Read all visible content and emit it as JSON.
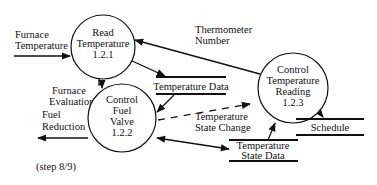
{
  "diagram": {
    "type": "data-flow-diagram",
    "caption": "(step 8/9)",
    "processes": [
      {
        "id": "1.2.1",
        "line1": "Read",
        "line2": "Temperature",
        "line3": "1.2.1"
      },
      {
        "id": "1.2.2",
        "line1": "Control",
        "line2": "Fuel",
        "line3": "Valve",
        "line4": "1.2.2"
      },
      {
        "id": "1.2.3",
        "line1": "Control",
        "line2": "Temperature",
        "line3": "Reading",
        "line4": "1.2.3"
      }
    ],
    "stores": [
      {
        "label": "Temperature Data"
      },
      {
        "label": "Schedule"
      },
      {
        "line1": "Temperature",
        "line2": "State Data"
      }
    ],
    "flows": [
      {
        "line1": "Furnace",
        "line2": "Temperature",
        "from": "external",
        "to": "1.2.1"
      },
      {
        "line1": "Thermometer",
        "line2": "Number",
        "from": "1.2.3",
        "to": "1.2.1"
      },
      {
        "label": "",
        "from": "1.2.1",
        "to": "Temperature Data"
      },
      {
        "line1": "Furnace",
        "line2": "Evaluation",
        "from": "1.2.1",
        "to": "1.2.2"
      },
      {
        "label": "",
        "from": "Temperature Data",
        "to": "1.2.2"
      },
      {
        "line1": "Fuel",
        "line2": "Reduction",
        "from": "1.2.2",
        "to": "external"
      },
      {
        "line1": "Temperature",
        "line2": "State Change",
        "from": "1.2.2",
        "to": "1.2.3",
        "style": "dashed"
      },
      {
        "label": "",
        "from": "1.2.2",
        "to": "Temperature State Data",
        "bidirectional": true
      },
      {
        "label": "",
        "from": "Temperature State Data",
        "to": "1.2.3"
      },
      {
        "label": "",
        "from": "1.2.3",
        "to": "Schedule",
        "bidirectional": true
      }
    ]
  }
}
